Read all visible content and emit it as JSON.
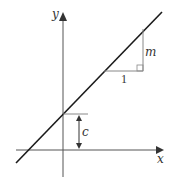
{
  "diagram": {
    "axes": {
      "x_label": "x",
      "y_label": "y"
    },
    "annotations": {
      "gradient_label": "m",
      "run_label": "1",
      "intercept_label": "c"
    },
    "colors": {
      "line": "#1a1a1a",
      "axes": "#555555",
      "guides": "#888888"
    }
  }
}
